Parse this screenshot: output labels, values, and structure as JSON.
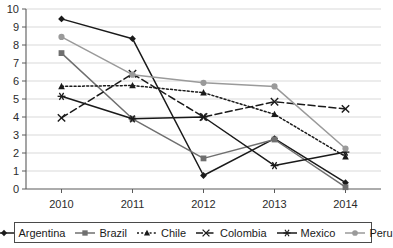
{
  "chart_data": {
    "type": "line",
    "title": "",
    "xlabel": "",
    "ylabel": "",
    "categories": [
      "2010",
      "2011",
      "2012",
      "2013",
      "2014"
    ],
    "ylim": [
      0,
      10
    ],
    "ytick_step": 1,
    "yticks": [
      "10",
      "9",
      "8",
      "7",
      "6",
      "5",
      "4",
      "3",
      "2",
      "1",
      "0"
    ],
    "grid": true,
    "legend_position": "bottom",
    "series": [
      {
        "name": "Argentina",
        "values": [
          9.45,
          8.35,
          0.75,
          2.8,
          0.35
        ],
        "color": "#1a1a1a",
        "marker": "diamond",
        "dash": "none"
      },
      {
        "name": "Brazil",
        "values": [
          7.55,
          3.9,
          1.7,
          2.75,
          0.1
        ],
        "color": "#6f6f6f",
        "marker": "square",
        "dash": "none"
      },
      {
        "name": "Chile",
        "values": [
          5.7,
          5.75,
          5.35,
          4.15,
          1.8
        ],
        "color": "#1a1a1a",
        "marker": "triangle",
        "dash": "dotted"
      },
      {
        "name": "Colombia",
        "values": [
          3.95,
          6.4,
          4.0,
          4.85,
          4.45
        ],
        "color": "#1a1a1a",
        "marker": "cross",
        "dash": "dashed"
      },
      {
        "name": "Mexico",
        "values": [
          5.15,
          3.9,
          4.0,
          1.3,
          2.05
        ],
        "color": "#1a1a1a",
        "marker": "asterisk",
        "dash": "none"
      },
      {
        "name": "Peru",
        "values": [
          8.45,
          6.35,
          5.9,
          5.7,
          2.25
        ],
        "color": "#9a9a9a",
        "marker": "circle",
        "dash": "none"
      }
    ]
  }
}
